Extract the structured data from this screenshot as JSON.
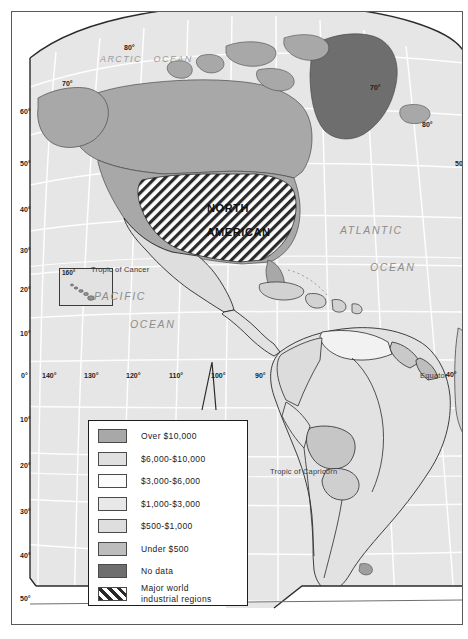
{
  "map": {
    "title_region": "NORTH AMERICAN",
    "ocean_labels": [
      {
        "name": "arctic-ocean",
        "text": "ARCTIC   OCEAN",
        "x": 88,
        "y": 42,
        "cls": "arctic-lbl"
      },
      {
        "name": "atlantic-ocean-line1",
        "text": "ATLANTIC",
        "x": 328,
        "y": 212,
        "cls": "ocean-lbl"
      },
      {
        "name": "atlantic-ocean-line2",
        "text": "OCEAN",
        "x": 358,
        "y": 249,
        "cls": "ocean-lbl"
      },
      {
        "name": "pacific-ocean-line1",
        "text": "PACIFIC",
        "x": 82,
        "y": 278,
        "cls": "ocean-lbl"
      },
      {
        "name": "pacific-ocean-line2",
        "text": "OCEAN",
        "x": 118,
        "y": 306,
        "cls": "ocean-lbl"
      }
    ],
    "reference_lines": [
      {
        "name": "tropic-of-cancer",
        "text": "Tropic of Cancer",
        "x": 79,
        "y": 253
      },
      {
        "name": "tropic-of-capricorn",
        "text": "Tropic of Capricorn",
        "x": 258,
        "y": 455
      },
      {
        "name": "equator",
        "text": "Equator",
        "x": 408,
        "y": 359
      }
    ],
    "latitude_labels_left": [
      {
        "text": "60°",
        "x": 8,
        "y": 96
      },
      {
        "text": "50°",
        "x": 8,
        "y": 148
      },
      {
        "text": "40°",
        "x": 8,
        "y": 194
      },
      {
        "text": "30°",
        "x": 8,
        "y": 235
      },
      {
        "text": "20°",
        "x": 8,
        "y": 274
      },
      {
        "text": "10°",
        "x": 8,
        "y": 318
      },
      {
        "text": "0°",
        "x": 9,
        "y": 360
      },
      {
        "text": "10°",
        "x": 8,
        "y": 404
      },
      {
        "text": "20°",
        "x": 8,
        "y": 450
      },
      {
        "text": "30°",
        "x": 8,
        "y": 496
      },
      {
        "text": "40°",
        "x": 8,
        "y": 540
      },
      {
        "text": "50°",
        "x": 8,
        "y": 583
      }
    ],
    "latitude_labels_right": [
      {
        "text": "70°",
        "x": 358,
        "y": 72
      },
      {
        "text": "80°",
        "x": 410,
        "y": 109
      },
      {
        "text": "50°",
        "x": 443,
        "y": 148
      },
      {
        "text": "40°",
        "x": 434,
        "y": 359
      }
    ],
    "graticule_top_labels": [
      {
        "text": "80°",
        "x": 112,
        "y": 32
      },
      {
        "text": "70°",
        "x": 50,
        "y": 68
      }
    ],
    "longitude_labels_bottom": [
      {
        "text": "140°",
        "x": 30,
        "y": 360
      },
      {
        "text": "130°",
        "x": 72,
        "y": 360
      },
      {
        "text": "120°",
        "x": 114,
        "y": 360
      },
      {
        "text": "110°",
        "x": 157,
        "y": 360
      },
      {
        "text": "100°",
        "x": 199,
        "y": 360
      },
      {
        "text": "90°",
        "x": 243,
        "y": 360
      }
    ],
    "inset": {
      "name": "hawaii-inset",
      "label": "160°"
    }
  },
  "legend": {
    "items": [
      {
        "label": "Over $10,000",
        "color": "#a8a8a8",
        "pattern": "solid"
      },
      {
        "label": "$6,000-$10,000",
        "color": "#e0e0e0",
        "pattern": "solid"
      },
      {
        "label": "$3,000-$6,000",
        "color": "#fbfbfb",
        "pattern": "solid"
      },
      {
        "label": "$1,000-$3,000",
        "color": "#e8e8e8",
        "pattern": "solid"
      },
      {
        "label": "$500-$1,000",
        "color": "#dedede",
        "pattern": "solid"
      },
      {
        "label": "Under $500",
        "color": "#bdbdbd",
        "pattern": "solid"
      },
      {
        "label": "No data",
        "color": "#6e6e6e",
        "pattern": "solid"
      },
      {
        "label": "Major world\nindustrial regions",
        "color": "#ffffff",
        "pattern": "hatch"
      }
    ]
  },
  "colors": {
    "ocean": "#e6e6e6",
    "graticule": "#ffffff",
    "coast": "#4a4a4a",
    "border": "#2b2b2b",
    "frame": "#5a5a5a",
    "land_over10k": "#a8a8a8",
    "land_nodata": "#6e6e6e",
    "land_mid": "#cfcfcf",
    "land_light": "#e8e8e8"
  }
}
